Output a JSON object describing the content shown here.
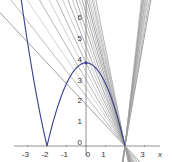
{
  "chart_data": {
    "type": "line",
    "title": "",
    "xlabel": "x",
    "ylabel": "y",
    "xlim": [
      -4.4,
      4.4
    ],
    "ylim": [
      -0.7,
      7.0
    ],
    "grid": false,
    "legend": null,
    "x_ticks": [
      "-3",
      "-2",
      "-1",
      "0",
      "1",
      "3"
    ],
    "y_ticks": [
      "0",
      "1",
      "2",
      "3",
      "4",
      "5",
      "6"
    ],
    "colors": {
      "curve": "#3b3f8f",
      "secants": "#8a8a8a",
      "axis": "#777777"
    },
    "series": [
      {
        "name": "f(x) = |x^2 - 4|",
        "kind": "curve",
        "x": [
          -3.3,
          -3.0,
          -2.5,
          -2.0,
          -1.5,
          -1.0,
          -0.5,
          0.0,
          0.5,
          1.0,
          1.5,
          2.0
        ],
        "y": [
          6.89,
          5.0,
          2.25,
          0.0,
          1.75,
          3.0,
          3.75,
          4.0,
          3.75,
          3.0,
          1.75,
          0.0
        ]
      },
      {
        "name": "secant lines through (2, 0) from the left",
        "kind": "line-fan",
        "anchor": [
          2,
          0
        ],
        "slopes": [
          -1.0,
          -1.2,
          -1.4,
          -1.6,
          -1.8,
          -2.0,
          -2.2,
          -2.4,
          -2.6,
          -2.8,
          -3.0,
          -3.2,
          -3.4,
          -3.6,
          -3.8,
          -4.0,
          -4.2,
          -4.4,
          -4.7
        ]
      },
      {
        "name": "secant lines through (2, 0) from the right",
        "kind": "line-fan",
        "anchor": [
          2,
          0
        ],
        "slopes": [
          5.3,
          5.6,
          5.9,
          6.2,
          6.5,
          6.8,
          7.1,
          7.4,
          7.7,
          8.0,
          8.4
        ]
      }
    ],
    "annotations": [
      {
        "label": "peak point",
        "x": 0,
        "y": 4
      },
      {
        "label": "corner point",
        "x": 2,
        "y": 0
      },
      {
        "label": "corner point",
        "x": -2,
        "y": 0
      }
    ]
  }
}
